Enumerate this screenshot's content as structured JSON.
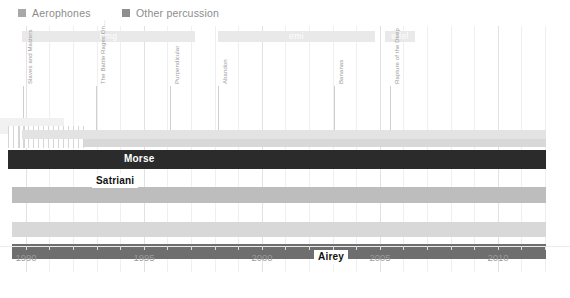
{
  "legend": {
    "items": [
      {
        "label": "Aerophones",
        "color": "#a8a8a8",
        "x": 18
      },
      {
        "label": "Other percussion",
        "color": "#8e8e8e",
        "x": 122
      }
    ]
  },
  "labels_bands": [
    {
      "name": "bmg",
      "x": 22,
      "width": 173,
      "color": "#e9e9e9",
      "text_color": "#ffffff"
    },
    {
      "name": "emi",
      "x": 218,
      "width": 157,
      "color": "#e9e9e9",
      "text_color": "#ffffff"
    },
    {
      "name": "edel",
      "x": 385,
      "width": 30,
      "color": "#e9e9e9",
      "text_color": "#ffffff"
    }
  ],
  "annotations": [
    {
      "label": "Slaves and Masters",
      "x": 23,
      "top": 53,
      "line_top": 60,
      "line_height": 48
    },
    {
      "label": "The Battle Rages On…",
      "x": 96,
      "top": 53,
      "line_top": 60,
      "line_height": 48
    },
    {
      "label": "Purpendicular",
      "x": 170,
      "top": 53,
      "line_top": 60,
      "line_height": 48
    },
    {
      "label": "Abandon",
      "x": 218,
      "top": 53,
      "line_top": 60,
      "line_height": 48
    },
    {
      "label": "Bananas",
      "x": 334,
      "top": 53,
      "line_top": 60,
      "line_height": 48
    },
    {
      "label": "Rapture of the Deep",
      "x": 390,
      "top": 53,
      "line_top": 60,
      "line_height": 48
    }
  ],
  "rows": [
    {
      "name": "row-pale-top",
      "style": "lighter",
      "x": 22,
      "width": 524,
      "top": 104,
      "height": 9
    },
    {
      "name": "row-gray-1",
      "style": "light",
      "x": 84,
      "width": 462,
      "top": 113,
      "height": 8
    },
    {
      "name": "row-dark-1",
      "style": "darkest",
      "x": 8,
      "width": 538,
      "top": 124,
      "height": 19
    },
    {
      "name": "row-gray-2",
      "style": "mid",
      "x": 12,
      "width": 534,
      "top": 161,
      "height": 16
    },
    {
      "name": "row-gray-3",
      "style": "light",
      "x": 12,
      "width": 534,
      "top": 196,
      "height": 15
    },
    {
      "name": "row-dark-2",
      "style": "dark",
      "x": 12,
      "width": 534,
      "top": 218,
      "height": 15
    }
  ],
  "member_chips": [
    {
      "label": "Morse",
      "x": 120,
      "top": 126,
      "on": "dark"
    },
    {
      "label": "Satriani",
      "x": 92,
      "top": 148,
      "on": "light"
    },
    {
      "label": "Airey",
      "x": 314,
      "top": 224,
      "on": "light"
    }
  ],
  "hatch": {
    "x": 8,
    "width": 76,
    "top": 100,
    "height": 22
  },
  "hatch_pale": {
    "x": 0,
    "width": 64,
    "top": 92,
    "height": 16
  },
  "xaxis": {
    "ticks": [
      {
        "label": "1990",
        "x": 26
      },
      {
        "label": "1995",
        "x": 144
      },
      {
        "label": "2000",
        "x": 262
      },
      {
        "label": "2005",
        "x": 380
      },
      {
        "label": "2010",
        "x": 498
      }
    ],
    "minor_tick_xs": [
      26,
      49,
      73,
      97,
      120,
      144,
      167,
      191,
      215,
      238,
      262,
      285,
      309,
      333,
      356,
      380,
      403,
      427,
      451,
      474,
      498,
      521,
      545
    ],
    "range": [
      1989,
      2012
    ]
  },
  "gridlines": {
    "major_xs": [
      26,
      144,
      262,
      380,
      498
    ],
    "minor_xs": [
      49,
      73,
      97,
      120,
      167,
      191,
      215,
      238,
      285,
      309,
      333,
      356,
      403,
      427,
      451,
      474,
      521,
      545
    ]
  },
  "chart_data": {
    "type": "bar",
    "title": "",
    "xlabel": "",
    "ylabel": "",
    "xlim": [
      1989,
      2012
    ],
    "grid": true,
    "legend_position": "top-left",
    "categories": [
      "Aerophones",
      "Other percussion"
    ],
    "series": [
      {
        "name": "Morse",
        "start": 1994.5,
        "end": 2012.5
      },
      {
        "name": "Satriani",
        "start": 1993.5,
        "end": 1994.4
      },
      {
        "name": "Airey",
        "start": 2002.0,
        "end": 2012.5
      }
    ],
    "label_periods": [
      {
        "name": "bmg",
        "start": 1989.6,
        "end": 1996.9
      },
      {
        "name": "emi",
        "start": 1997.9,
        "end": 2004.6
      },
      {
        "name": "edel",
        "start": 2005.0,
        "end": 2006.2
      }
    ],
    "album_releases": [
      {
        "title": "Slaves and Masters",
        "year": 1990
      },
      {
        "title": "The Battle Rages On…",
        "year": 1993
      },
      {
        "title": "Purpendicular",
        "year": 1996
      },
      {
        "title": "Abandon",
        "year": 1998
      },
      {
        "title": "Bananas",
        "year": 2003
      },
      {
        "title": "Rapture of the Deep",
        "year": 2005
      }
    ]
  }
}
